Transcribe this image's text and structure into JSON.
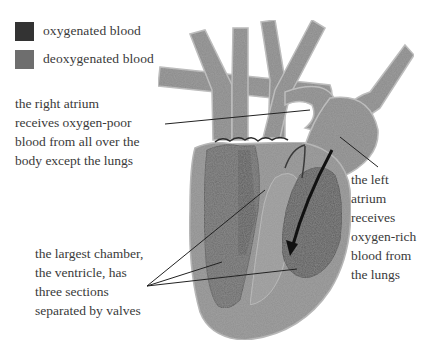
{
  "legend": {
    "items": [
      {
        "label": "oxygenated blood",
        "color": "#333333",
        "icon": "oxygenated-swatch"
      },
      {
        "label": "deoxygenated blood",
        "color": "#6e6e6e",
        "icon": "deoxygenated-swatch"
      }
    ]
  },
  "annotations": {
    "right_atrium": {
      "lines": [
        "the right atrium",
        "receives oxygen-poor",
        "blood from all over the",
        "body except the lungs"
      ]
    },
    "left_atrium": {
      "lines": [
        "the left",
        "atrium",
        "receives",
        "oxygen-rich",
        "blood from",
        "the lungs"
      ]
    },
    "ventricle": {
      "lines": [
        "the largest chamber,",
        "the ventricle, has",
        "three sections",
        "separated by valves"
      ]
    }
  },
  "colors": {
    "oxygenated": "#3f3f3f",
    "deoxygenated": "#6e6e6e",
    "muscle": "#8f8f8f",
    "vessel": "#8a8a8a",
    "vessel_edge": "#bdbdbd",
    "leader_line": "#222222",
    "arrow": "#111111"
  }
}
